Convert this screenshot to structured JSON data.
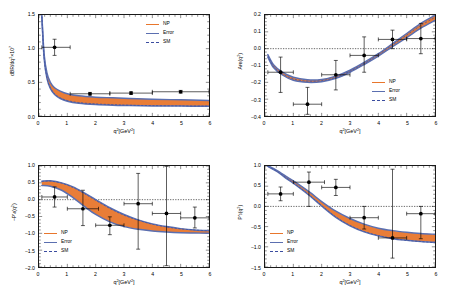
{
  "figure": {
    "background": "#ffffff",
    "np_color": "#E8762C",
    "error_color": "#5B6FB0",
    "sm_color": "#3B4DA0",
    "point_color": "#000000"
  },
  "legend": {
    "np_label": "NP",
    "error_label": "Error",
    "sm_label": "SM"
  },
  "chart_data": [
    {
      "id": "panel-br",
      "type": "line",
      "title": "",
      "xlabel": "q²[GeV²]",
      "ylabel": "dBR/dq²×10⁷",
      "xlim": [
        0,
        6
      ],
      "ylim": [
        0.0,
        1.5
      ],
      "xticks": [
        0,
        1,
        2,
        3,
        4,
        5,
        6
      ],
      "xticklabels": [
        "0",
        "1",
        "2",
        "3",
        "4",
        "5",
        "6"
      ],
      "yticks": [
        0.0,
        0.5,
        1.0,
        1.5
      ],
      "yticklabels": [
        "0.0",
        "0.5",
        "1.0",
        "1.5"
      ],
      "grid": false,
      "zero_line": false,
      "legend_position": "top-right",
      "series": [
        {
          "name": "NP",
          "kind": "band",
          "x": [
            0.1,
            0.18,
            0.28,
            0.4,
            0.55,
            0.75,
            1.0,
            1.4,
            2.0,
            2.6,
            3.2,
            4.0,
            5.0,
            6.0
          ],
          "upper": [
            1.5,
            0.92,
            0.64,
            0.5,
            0.42,
            0.37,
            0.33,
            0.3,
            0.28,
            0.27,
            0.26,
            0.25,
            0.24,
            0.23
          ],
          "lower": [
            1.47,
            0.86,
            0.56,
            0.41,
            0.32,
            0.26,
            0.22,
            0.19,
            0.17,
            0.16,
            0.155,
            0.15,
            0.147,
            0.145
          ]
        },
        {
          "name": "SM",
          "kind": "dashed-line",
          "x": [
            0.1,
            0.18,
            0.28,
            0.4,
            0.55,
            0.75,
            1.0,
            1.4,
            2.0,
            2.6,
            3.2,
            4.0,
            5.0,
            6.0
          ],
          "y": [
            1.48,
            0.87,
            0.57,
            0.42,
            0.33,
            0.27,
            0.23,
            0.2,
            0.18,
            0.17,
            0.16,
            0.155,
            0.15,
            0.148
          ]
        }
      ],
      "points": [
        {
          "x": 0.55,
          "y": 1.02,
          "xerr_lo": 0.45,
          "xerr_hi": 0.55,
          "yerr_lo": 0.12,
          "yerr_hi": 0.12
        },
        {
          "x": 1.8,
          "y": 0.33,
          "xerr_lo": 0.7,
          "xerr_hi": 0.7,
          "yerr_lo": 0.02,
          "yerr_hi": 0.02
        },
        {
          "x": 3.25,
          "y": 0.34,
          "xerr_lo": 0.75,
          "xerr_hi": 0.75,
          "yerr_lo": 0.02,
          "yerr_hi": 0.02
        },
        {
          "x": 5.0,
          "y": 0.36,
          "xerr_lo": 1.0,
          "xerr_hi": 1.0,
          "yerr_lo": 0.02,
          "yerr_hi": 0.02
        }
      ]
    },
    {
      "id": "panel-afb",
      "type": "line",
      "title": "",
      "xlabel": "q²[GeV²]",
      "ylabel": "Aᶠʙ(q²)",
      "ylabel_main": "A",
      "ylabel_sub": "FB",
      "ylabel_tail": "(q²)",
      "xlim": [
        0,
        6
      ],
      "ylim": [
        -0.4,
        0.2
      ],
      "xticks": [
        0,
        1,
        2,
        3,
        4,
        5,
        6
      ],
      "xticklabels": [
        "0",
        "1",
        "2",
        "3",
        "4",
        "5",
        "6"
      ],
      "yticks": [
        -0.4,
        -0.3,
        -0.2,
        -0.1,
        0.0,
        0.1,
        0.2
      ],
      "yticklabels": [
        "-0.4",
        "-0.3",
        "-0.2",
        "-0.1",
        "0.0",
        "0.1",
        "0.2"
      ],
      "grid": false,
      "zero_line": true,
      "legend_position": "bottom-right",
      "series": [
        {
          "name": "NP",
          "kind": "band",
          "x": [
            0.1,
            0.3,
            0.6,
            1.0,
            1.5,
            2.0,
            2.5,
            3.0,
            3.5,
            4.0,
            4.5,
            5.0,
            5.5,
            6.0
          ],
          "upper": [
            -0.035,
            -0.095,
            -0.138,
            -0.17,
            -0.185,
            -0.183,
            -0.163,
            -0.128,
            -0.082,
            -0.03,
            0.03,
            0.09,
            0.15,
            0.198
          ],
          "lower": [
            -0.05,
            -0.112,
            -0.155,
            -0.188,
            -0.2,
            -0.196,
            -0.176,
            -0.14,
            -0.094,
            -0.044,
            0.012,
            0.066,
            0.122,
            0.168
          ]
        },
        {
          "name": "SM",
          "kind": "dashed-line",
          "x": [
            0.1,
            0.3,
            0.6,
            1.0,
            1.5,
            2.0,
            2.5,
            3.0,
            3.5,
            4.0,
            4.5,
            5.0,
            5.5,
            6.0
          ],
          "y": [
            -0.042,
            -0.104,
            -0.147,
            -0.18,
            -0.193,
            -0.19,
            -0.17,
            -0.134,
            -0.088,
            -0.036,
            0.022,
            0.08,
            0.138,
            0.186
          ]
        }
      ],
      "points": [
        {
          "x": 0.55,
          "y": -0.14,
          "xerr_lo": 0.45,
          "xerr_hi": 0.45,
          "yerr_lo": 0.12,
          "yerr_hi": 0.09
        },
        {
          "x": 1.5,
          "y": -0.33,
          "xerr_lo": 0.5,
          "xerr_hi": 0.5,
          "yerr_lo": 0.06,
          "yerr_hi": 0.1
        },
        {
          "x": 2.5,
          "y": -0.155,
          "xerr_lo": 0.5,
          "xerr_hi": 0.5,
          "yerr_lo": 0.09,
          "yerr_hi": 0.085
        },
        {
          "x": 3.5,
          "y": -0.04,
          "xerr_lo": 0.5,
          "xerr_hi": 0.5,
          "yerr_lo": 0.1,
          "yerr_hi": 0.11
        },
        {
          "x": 4.5,
          "y": 0.055,
          "xerr_lo": 0.5,
          "xerr_hi": 0.5,
          "yerr_lo": 0.055,
          "yerr_hi": 0.055
        },
        {
          "x": 5.5,
          "y": 0.06,
          "xerr_lo": 0.5,
          "xerr_hi": 0.5,
          "yerr_lo": 0.09,
          "yerr_hi": 0.09
        }
      ]
    },
    {
      "id": "panel-p4p",
      "type": "line",
      "title": "",
      "xlabel": "q²[GeV²]",
      "ylabel": "−P'₄(q²)",
      "xlim": [
        0,
        6
      ],
      "ylim": [
        -2.0,
        1.0
      ],
      "xticks": [
        0,
        1,
        2,
        3,
        4,
        5,
        6
      ],
      "xticklabels": [
        "0",
        "1",
        "2",
        "3",
        "4",
        "5",
        "6"
      ],
      "yticks": [
        -2.0,
        -1.5,
        -1.0,
        -0.5,
        0.0,
        0.5,
        1.0
      ],
      "yticklabels": [
        "-2.0",
        "-1.5",
        "-1.0",
        "-0.5",
        "0.0",
        "0.5",
        "1.0"
      ],
      "grid": false,
      "zero_line": true,
      "legend_position": "bottom-left",
      "series": [
        {
          "name": "NP",
          "kind": "band",
          "x": [
            0.1,
            0.4,
            0.8,
            1.2,
            1.6,
            2.0,
            2.5,
            3.0,
            3.5,
            4.0,
            4.5,
            5.0,
            5.5,
            6.0
          ],
          "upper": [
            0.55,
            0.56,
            0.5,
            0.38,
            0.2,
            0.0,
            -0.24,
            -0.44,
            -0.6,
            -0.72,
            -0.8,
            -0.86,
            -0.9,
            -0.92
          ],
          "lower": [
            0.42,
            0.4,
            0.28,
            0.06,
            -0.2,
            -0.44,
            -0.66,
            -0.8,
            -0.88,
            -0.93,
            -0.96,
            -0.98,
            -0.99,
            -1.0
          ]
        },
        {
          "name": "SM",
          "kind": "dashed-line",
          "x": [
            0.1,
            0.4,
            0.8,
            1.2,
            1.6,
            2.0,
            2.5,
            3.0,
            3.5,
            4.0,
            4.5,
            5.0,
            5.5,
            6.0
          ],
          "y": [
            0.54,
            0.55,
            0.49,
            0.36,
            0.18,
            -0.02,
            -0.26,
            -0.46,
            -0.61,
            -0.73,
            -0.81,
            -0.87,
            -0.9,
            -0.93
          ]
        }
      ],
      "points": [
        {
          "x": 0.55,
          "y": 0.08,
          "xerr_lo": 0.45,
          "xerr_hi": 0.45,
          "yerr_lo": 0.3,
          "yerr_hi": 0.3
        },
        {
          "x": 1.55,
          "y": -0.27,
          "xerr_lo": 0.55,
          "xerr_hi": 0.55,
          "yerr_lo": 0.5,
          "yerr_hi": 0.55
        },
        {
          "x": 2.5,
          "y": -0.76,
          "xerr_lo": 0.5,
          "xerr_hi": 0.5,
          "yerr_lo": 0.28,
          "yerr_hi": 0.25
        },
        {
          "x": 3.5,
          "y": -0.12,
          "xerr_lo": 0.5,
          "xerr_hi": 0.5,
          "yerr_lo": 1.35,
          "yerr_hi": 0.9
        },
        {
          "x": 4.5,
          "y": -0.41,
          "xerr_lo": 0.5,
          "xerr_hi": 0.5,
          "yerr_lo": 1.55,
          "yerr_hi": 1.4
        },
        {
          "x": 5.5,
          "y": -0.54,
          "xerr_lo": 0.5,
          "xerr_hi": 0.5,
          "yerr_lo": 0.3,
          "yerr_hi": 0.32
        }
      ]
    },
    {
      "id": "panel-p5p",
      "type": "line",
      "title": "",
      "xlabel": "q²[GeV²]",
      "ylabel": "P'₅(q²)",
      "xlim": [
        0,
        6
      ],
      "ylim": [
        -1.5,
        1.0
      ],
      "xticks": [
        0,
        1,
        2,
        3,
        4,
        5,
        6
      ],
      "xticklabels": [
        "0",
        "1",
        "2",
        "3",
        "4",
        "5",
        "6"
      ],
      "yticks": [
        -1.5,
        -1.0,
        -0.5,
        0.0,
        0.5,
        1.0
      ],
      "yticklabels": [
        "-1.5",
        "-1.0",
        "-0.5",
        "0.0",
        "0.5",
        "1.0"
      ],
      "grid": false,
      "zero_line": true,
      "legend_position": "bottom-left",
      "series": [
        {
          "name": "NP",
          "kind": "band",
          "x": [
            0.1,
            0.4,
            0.8,
            1.2,
            1.6,
            2.0,
            2.5,
            3.0,
            3.5,
            4.0,
            4.5,
            5.0,
            5.5,
            6.0
          ],
          "upper": [
            1.0,
            0.9,
            0.72,
            0.54,
            0.34,
            0.12,
            -0.12,
            -0.3,
            -0.44,
            -0.54,
            -0.6,
            -0.64,
            -0.67,
            -0.69
          ],
          "lower": [
            0.99,
            0.87,
            0.67,
            0.47,
            0.25,
            0.01,
            -0.27,
            -0.48,
            -0.63,
            -0.73,
            -0.8,
            -0.84,
            -0.87,
            -0.89
          ]
        },
        {
          "name": "SM",
          "kind": "dashed-line",
          "x": [
            0.1,
            0.4,
            0.8,
            1.2,
            1.6,
            2.0,
            2.5,
            3.0,
            3.5,
            4.0,
            4.5,
            5.0,
            5.5,
            6.0
          ],
          "y": [
            0.99,
            0.88,
            0.68,
            0.48,
            0.26,
            0.02,
            -0.26,
            -0.47,
            -0.62,
            -0.72,
            -0.79,
            -0.84,
            -0.87,
            -0.9
          ]
        }
      ],
      "points": [
        {
          "x": 0.55,
          "y": 0.31,
          "xerr_lo": 0.45,
          "xerr_hi": 0.45,
          "yerr_lo": 0.17,
          "yerr_hi": 0.17
        },
        {
          "x": 1.55,
          "y": 0.6,
          "xerr_lo": 0.55,
          "xerr_hi": 0.55,
          "yerr_lo": 0.6,
          "yerr_hi": 0.25
        },
        {
          "x": 2.5,
          "y": 0.47,
          "xerr_lo": 0.5,
          "xerr_hi": 0.5,
          "yerr_lo": 0.2,
          "yerr_hi": 0.2
        },
        {
          "x": 3.5,
          "y": -0.28,
          "xerr_lo": 0.5,
          "xerr_hi": 0.5,
          "yerr_lo": 0.28,
          "yerr_hi": 0.28
        },
        {
          "x": 4.5,
          "y": -0.78,
          "xerr_lo": 0.5,
          "xerr_hi": 0.5,
          "yerr_lo": 0.5,
          "yerr_hi": 1.7
        },
        {
          "x": 5.5,
          "y": -0.18,
          "xerr_lo": 0.5,
          "xerr_hi": 0.5,
          "yerr_lo": 0.62,
          "yerr_hi": 0.18
        }
      ]
    }
  ]
}
